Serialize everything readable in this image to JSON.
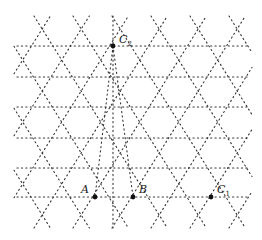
{
  "diagram": {
    "type": "triangular-lattice",
    "line_style": "dotted",
    "line_color": "#333333",
    "point_color": "#111111",
    "rows_y": [
      46,
      77,
      107,
      138,
      168,
      197
    ],
    "row_x_range": [
      17,
      250
    ],
    "even_row_nodes_x": [
      35,
      74,
      113,
      152,
      191,
      230
    ],
    "odd_row_nodes_x": [
      16,
      55,
      94,
      133,
      172,
      211,
      250
    ],
    "top_y": 16,
    "bottom_y": 228,
    "points": [
      {
        "id": "C2",
        "label": "C",
        "sub": "2",
        "x": 113,
        "y": 46,
        "lx": 119,
        "ly": 43
      },
      {
        "id": "A",
        "label": "A",
        "sub": "",
        "x": 95,
        "y": 197,
        "lx": 81,
        "ly": 193
      },
      {
        "id": "B",
        "label": "B",
        "sub": "",
        "x": 133,
        "y": 197,
        "lx": 139,
        "ly": 193
      },
      {
        "id": "C1",
        "label": "C",
        "sub": "1",
        "x": 211,
        "y": 197,
        "lx": 217,
        "ly": 193
      }
    ]
  }
}
